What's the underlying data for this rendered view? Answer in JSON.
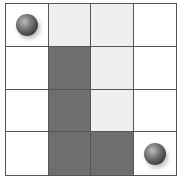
{
  "board": {
    "rows": 4,
    "cols": 4,
    "colors": {
      "white": "#ffffff",
      "light": "#efefef",
      "dark": "#6e6e6e",
      "grid_line": "#555555"
    },
    "cells": [
      [
        "white",
        "light",
        "light",
        "white"
      ],
      [
        "white",
        "dark",
        "light",
        "white"
      ],
      [
        "white",
        "dark",
        "light",
        "white"
      ],
      [
        "white",
        "dark",
        "dark",
        "white"
      ]
    ],
    "balls": [
      {
        "row": 0,
        "col": 0,
        "icon": "ball-icon"
      },
      {
        "row": 3,
        "col": 3,
        "icon": "ball-icon"
      }
    ]
  }
}
